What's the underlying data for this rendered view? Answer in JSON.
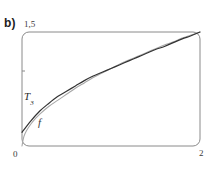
{
  "figure": {
    "panel_label": "b)",
    "frame": {
      "x0": 22,
      "y0": 32,
      "x1": 200,
      "y1": 146,
      "corner_radius": 7,
      "stroke_color": "#8a8a8a",
      "stroke_width": 1
    },
    "y_tick": {
      "value": 0.75,
      "x": 22,
      "y": 71,
      "length": 3
    }
  },
  "labels": {
    "y_max": "1,5",
    "x_min": "0",
    "x_max": "2",
    "curve_taylor": "T",
    "curve_taylor_subscript": "3",
    "curve_function": "f"
  },
  "colors": {
    "frame": "#8a8a8a",
    "curve_taylor": "#333333",
    "curve_function": "#a8a8a8",
    "text": "#2b2b2b",
    "background": "#ffffff"
  },
  "chart_data": {
    "type": "line",
    "title": "b)",
    "xlabel": "",
    "ylabel": "",
    "xlim": [
      0,
      2
    ],
    "ylim": [
      0,
      1.5
    ],
    "xticks": [
      0,
      2
    ],
    "xticklabels": [
      "0",
      "2"
    ],
    "yticks": [
      0.75,
      1.5
    ],
    "yticklabels": [
      "",
      "1,5"
    ],
    "grid": false,
    "legend": "inline-annotations",
    "annotations": [
      {
        "text": "T_3",
        "x": 0.05,
        "y": 0.72
      },
      {
        "text": "f",
        "x": 0.23,
        "y": 0.4
      }
    ],
    "series": [
      {
        "name": "T_3",
        "color": "#333333",
        "description": "third-order Taylor polynomial approximation, nearly linear near left edge, meets f at the upper right corner",
        "x": [
          0.0,
          0.1,
          0.2,
          0.3,
          0.4,
          0.5,
          0.6,
          0.7,
          0.8,
          0.9,
          1.0,
          1.1,
          1.2,
          1.3,
          1.4,
          1.5,
          1.6,
          1.7,
          1.8,
          1.9,
          2.0
        ],
        "y": [
          0.18,
          0.33,
          0.46,
          0.56,
          0.65,
          0.72,
          0.79,
          0.86,
          0.92,
          0.97,
          1.02,
          1.07,
          1.12,
          1.17,
          1.22,
          1.27,
          1.31,
          1.36,
          1.41,
          1.45,
          1.5
        ]
      },
      {
        "name": "f",
        "color": "#a8a8a8",
        "description": "square-root-like function through the origin, rises steeply then flattens, meets T_3 at the upper right corner",
        "x": [
          0.0,
          0.02,
          0.05,
          0.1,
          0.15,
          0.2,
          0.3,
          0.4,
          0.5,
          0.6,
          0.7,
          0.8,
          0.9,
          1.0,
          1.1,
          1.2,
          1.3,
          1.4,
          1.5,
          1.6,
          1.7,
          1.8,
          1.9,
          2.0
        ],
        "y": [
          0.0,
          0.12,
          0.2,
          0.29,
          0.36,
          0.42,
          0.52,
          0.6,
          0.68,
          0.76,
          0.83,
          0.9,
          0.96,
          1.02,
          1.08,
          1.13,
          1.18,
          1.23,
          1.28,
          1.33,
          1.37,
          1.42,
          1.46,
          1.5
        ]
      }
    ]
  }
}
